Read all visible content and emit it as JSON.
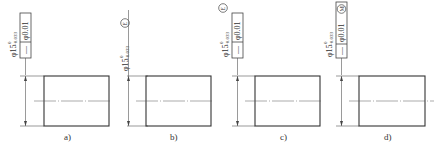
{
  "figures": [
    {
      "id": "a",
      "caption": "a)",
      "dimension": {
        "nominal": "φ15",
        "upper_dev": "0",
        "lower_dev": "−0.033",
        "modifier": ""
      },
      "frame": {
        "symbol": "—",
        "tolerance": "φ0.01",
        "modifier": ""
      }
    },
    {
      "id": "b",
      "caption": "b)",
      "dimension": {
        "nominal": "φ15",
        "upper_dev": "0",
        "lower_dev": "−0.033",
        "modifier": "E"
      },
      "frame": null
    },
    {
      "id": "c",
      "caption": "c)",
      "dimension": {
        "nominal": "φ15",
        "upper_dev": "0",
        "lower_dev": "−0.033",
        "modifier": "E"
      },
      "frame": {
        "symbol": "—",
        "tolerance": "φ0.01",
        "modifier": ""
      }
    },
    {
      "id": "d",
      "caption": "d)",
      "dimension": {
        "nominal": "φ15",
        "upper_dev": "0",
        "lower_dev": "−0.033",
        "modifier": ""
      },
      "frame": {
        "symbol": "—",
        "tolerance": "φ0.01",
        "modifier": "M"
      }
    }
  ],
  "colors": {
    "line": "#333333",
    "thin": "#555555",
    "background": "#ffffff"
  }
}
